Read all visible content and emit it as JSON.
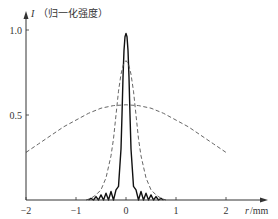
{
  "chart_data": {
    "type": "line",
    "title": "",
    "xlabel_var": "r",
    "xlabel_unit": "/mm",
    "ylabel_var": "I",
    "ylabel_text": "（归一化强度）",
    "xlim": [
      -2,
      2.8
    ],
    "ylim": [
      0,
      1.1
    ],
    "x_ticks": [
      -2,
      -1,
      0,
      1,
      2
    ],
    "x_tick_labels": [
      "−2",
      "−1",
      "0",
      "1",
      "2"
    ],
    "y_ticks": [
      0.5,
      1.0
    ],
    "y_tick_labels": [
      "0.5",
      "1.0"
    ],
    "grid": false,
    "legend": "none",
    "series": [
      {
        "name": "solid-narrow-peak",
        "style": "solid",
        "color": "#111111",
        "x": [
          -0.75,
          -0.7,
          -0.65,
          -0.6,
          -0.55,
          -0.5,
          -0.45,
          -0.4,
          -0.35,
          -0.3,
          -0.25,
          -0.2,
          -0.15,
          -0.1,
          -0.08,
          -0.06,
          -0.04,
          -0.02,
          0,
          0.02,
          0.04,
          0.06,
          0.08,
          0.1,
          0.15,
          0.2,
          0.25,
          0.3,
          0.35,
          0.4,
          0.45,
          0.5,
          0.55,
          0.6,
          0.65,
          0.7,
          0.75
        ],
        "y": [
          0.0,
          0.01,
          0.0,
          0.02,
          0.0,
          0.03,
          0.0,
          0.04,
          0.0,
          0.05,
          0.0,
          0.06,
          0.08,
          0.3,
          0.5,
          0.72,
          0.88,
          0.96,
          0.98,
          0.96,
          0.88,
          0.72,
          0.5,
          0.3,
          0.08,
          0.06,
          0.0,
          0.05,
          0.0,
          0.04,
          0.0,
          0.03,
          0.0,
          0.02,
          0.0,
          0.01,
          0.0
        ]
      },
      {
        "name": "dashed-medium-peak",
        "style": "dashed",
        "color": "#555555",
        "x": [
          -0.8,
          -0.7,
          -0.6,
          -0.5,
          -0.4,
          -0.3,
          -0.25,
          -0.2,
          -0.15,
          -0.1,
          -0.05,
          0,
          0.05,
          0.1,
          0.15,
          0.2,
          0.25,
          0.3,
          0.4,
          0.5,
          0.6,
          0.7,
          0.8
        ],
        "y": [
          0.0,
          0.01,
          0.03,
          0.06,
          0.13,
          0.26,
          0.36,
          0.5,
          0.64,
          0.74,
          0.8,
          0.82,
          0.8,
          0.74,
          0.64,
          0.5,
          0.36,
          0.26,
          0.13,
          0.06,
          0.03,
          0.01,
          0.0
        ]
      },
      {
        "name": "dashed-broad-curve",
        "style": "dashed",
        "color": "#555555",
        "x": [
          -2,
          -1.75,
          -1.5,
          -1.25,
          -1,
          -0.75,
          -0.5,
          -0.25,
          0,
          0.25,
          0.5,
          0.75,
          1,
          1.25,
          1.5,
          1.75,
          2
        ],
        "y": [
          0.28,
          0.33,
          0.38,
          0.43,
          0.47,
          0.51,
          0.54,
          0.555,
          0.56,
          0.555,
          0.54,
          0.51,
          0.47,
          0.43,
          0.38,
          0.33,
          0.28
        ]
      }
    ]
  }
}
